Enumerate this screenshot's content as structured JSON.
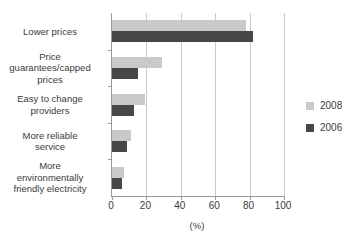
{
  "chart_data": {
    "type": "bar",
    "orientation": "horizontal",
    "title": "",
    "subtitle": "",
    "xlabel": "(%)",
    "ylabel": "",
    "xlim": [
      0,
      100
    ],
    "xticks": [
      0,
      20,
      40,
      60,
      80,
      100
    ],
    "xtick_labels": [
      "0",
      "20",
      "40",
      "60",
      "80",
      "100"
    ],
    "grid": "vertical",
    "legend_position": "right",
    "categories": [
      "Lower prices",
      "Price guarantees/capped prices",
      "Easy to change providers",
      "More reliable service",
      "More environmentally friendly electricity"
    ],
    "category_label_lines": [
      [
        "Lower prices"
      ],
      [
        "Price",
        "guarantees/capped",
        "prices"
      ],
      [
        "Easy to change",
        "providers"
      ],
      [
        "More reliable",
        "service"
      ],
      [
        "More",
        "environmentally",
        "friendly electricity"
      ]
    ],
    "series": [
      {
        "name": "2008",
        "color": "#c9c9c9",
        "values": [
          78,
          29,
          19,
          11,
          7
        ]
      },
      {
        "name": "2006",
        "color": "#474747",
        "values": [
          82,
          15,
          13,
          9,
          6
        ]
      }
    ]
  },
  "legend": {
    "items": [
      {
        "label": "2008",
        "color": "#c9c9c9"
      },
      {
        "label": "2006",
        "color": "#474747"
      }
    ]
  },
  "axis": {
    "x_title": "(%)"
  },
  "colors": {
    "series_2008": "#c9c9c9",
    "series_2006": "#474747",
    "axis_line": "#9a9a9a",
    "gridline": "#c9c9c9",
    "text": "#3b3b3b",
    "background": "#ffffff"
  }
}
